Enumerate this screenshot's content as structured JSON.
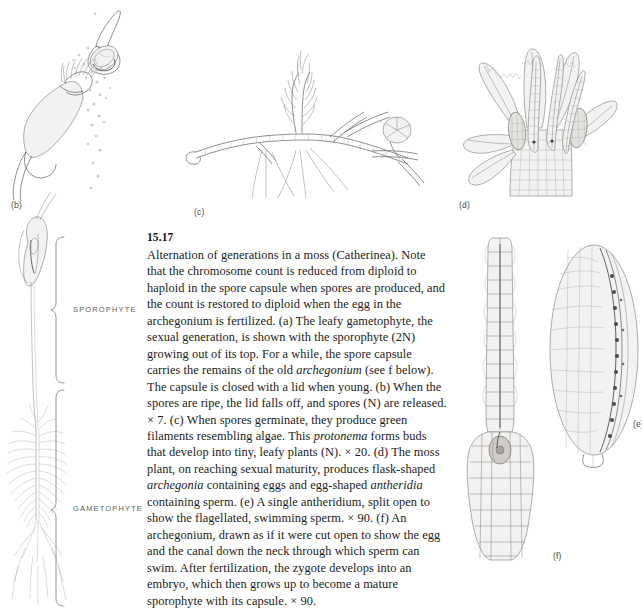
{
  "figure": {
    "number": "15.17",
    "caption_plain": "Alternation of generations in a moss (Catherinea). Note that the chromosome count is reduced from diploid to haploid in the spore capsule when spores are produced, and the count is restored to diploid when the egg in the archegonium is fertilized. (a) The leafy gametophyte, the sexual generation, is shown with the sporophyte (2N) growing out of its top. For a while, the spore capsule carries the remains of the old archegonium (see f below). The capsule is closed with a lid when young. (b) When the spores are ripe, the lid falls off, and spores (N) are released. × 7. (c) When spores germinate, they produce green filaments resembling algae. This protonema forms buds that develop into tiny, leafy plants (N). × 20. (d) The moss plant, on reaching sexual maturity, produces flask-shaped archegonia containing eggs and egg-shaped antheridia containing sperm. (e) A single antheridium, split open to show the flagellated, swimming sperm. × 90. (f) An archegonium, drawn as if it were cut open to show the egg and the canal down the neck through which sperm can swim. After fertilization, the zygote develops into an embryo, which then grows up to become a mature sporophyte with its capsule. × 90.",
    "caption_runs": [
      {
        "text": "Alternation of generations in a moss (Catherinea). Note that the chromosome count is reduced from diploid to haploid in the spore capsule when spores are produced, and the count is restored to diploid when the egg in the archegonium is fertilized. (a) The leafy gametophyte, the sexual generation, is shown with the sporophyte (2N) growing out of its top. For a while, the spore capsule carries the remains of the old ",
        "italic": false
      },
      {
        "text": "archegonium",
        "italic": true
      },
      {
        "text": " (see f below). The capsule is closed with a lid when young. (b) When the spores are ripe, the lid falls off, and spores (N) are released. × 7. (c) When spores germinate, they produce green filaments resembling algae. This ",
        "italic": false
      },
      {
        "text": "protonema",
        "italic": true
      },
      {
        "text": " forms buds that develop into tiny, leafy plants (N). × 20. (d) The moss plant, on reaching sexual maturity, produces flask-shaped ",
        "italic": false
      },
      {
        "text": "archegonia",
        "italic": true
      },
      {
        "text": " containing eggs and egg-shaped ",
        "italic": false
      },
      {
        "text": "antheridia",
        "italic": true
      },
      {
        "text": " containing sperm. (e) A single antheridium, split open to show the flagellated, swimming sperm. × 90. (f) An archegonium, drawn as if it were cut open to show the egg and the canal down the neck through which sperm can swim. After fertilization, the zygote develops into an embryo, which then grows up to become a mature sporophyte with its capsule. × 90.",
        "italic": false
      }
    ]
  },
  "panels": {
    "b": {
      "label": "(b)",
      "subject": "spore capsule with lid detached, releasing spores",
      "magnification": "× 7"
    },
    "c": {
      "label": "(c)",
      "subject": "protonema with filaments, bud and young leafy plant",
      "magnification": "× 20"
    },
    "d": {
      "label": "(d)",
      "subject": "moss plant apex with archegonia and antheridia",
      "magnification": ""
    },
    "e": {
      "label": "(e)",
      "subject": "single antheridium split open showing sperm",
      "magnification": "× 90"
    },
    "f": {
      "label": "(f)",
      "subject": "archegonium cut open showing egg and neck canal",
      "magnification": "× 90"
    }
  },
  "brackets": [
    {
      "label": "SPOROPHYTE",
      "generation": "2N"
    },
    {
      "label": "GAMETOPHYTE",
      "generation": "N"
    }
  ],
  "colors": {
    "page_background": "#ffffff",
    "ink": "#5e5e5e",
    "ink_dark": "#3c3c3c",
    "text": "#1b1b1b",
    "label_grey": "#5c5c5c",
    "tint": "#e4e2de"
  }
}
